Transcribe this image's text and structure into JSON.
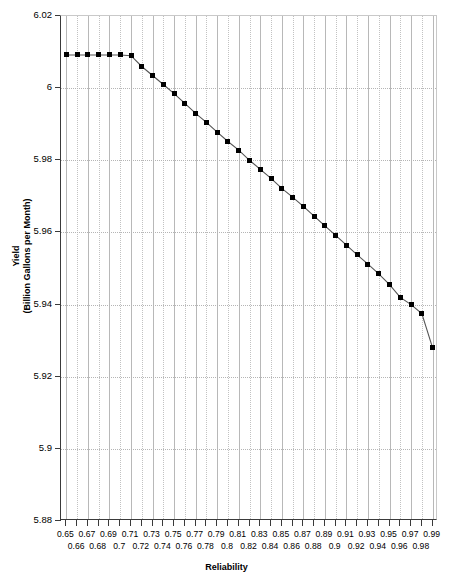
{
  "chart_data": {
    "type": "line",
    "title": "",
    "xlabel": "Reliability",
    "ylabel_line1": "Yield",
    "ylabel_line2": "(Billion Gallons per Month)",
    "xlim": [
      0.645,
      0.995
    ],
    "ylim": [
      5.88,
      6.02
    ],
    "grid": "vertical gridlines at every x tick (alternating solid/dotted), horizontal dotted gridlines at every y tick",
    "legend": "none",
    "marker": "filled black square",
    "line_color": "#555555",
    "marker_color": "#000000",
    "y_ticks": [
      5.88,
      5.9,
      5.92,
      5.94,
      5.96,
      5.98,
      6.0,
      6.02
    ],
    "y_tick_labels": [
      "5.88",
      "5.9",
      "5.92",
      "5.94",
      "5.96",
      "5.98",
      "6",
      "6.02"
    ],
    "x_ticks": [
      0.65,
      0.66,
      0.67,
      0.68,
      0.69,
      0.7,
      0.71,
      0.72,
      0.73,
      0.74,
      0.75,
      0.76,
      0.77,
      0.78,
      0.79,
      0.8,
      0.81,
      0.82,
      0.83,
      0.84,
      0.85,
      0.86,
      0.87,
      0.88,
      0.89,
      0.9,
      0.91,
      0.92,
      0.93,
      0.94,
      0.95,
      0.96,
      0.97,
      0.98,
      0.99
    ],
    "x_tick_labels_row1": [
      "0.65",
      "0.67",
      "0.69",
      "0.71",
      "0.73",
      "0.75",
      "0.77",
      "0.79",
      "0.81",
      "0.83",
      "0.85",
      "0.87",
      "0.89",
      "0.91",
      "0.93",
      "0.95",
      "0.97",
      "0.99"
    ],
    "x_tick_labels_row2": [
      "0.66",
      "0.68",
      "0.7",
      "0.72",
      "0.74",
      "0.76",
      "0.78",
      "0.8",
      "0.82",
      "0.84",
      "0.86",
      "0.88",
      "0.9",
      "0.92",
      "0.94",
      "0.96",
      "0.98"
    ],
    "x": [
      0.65,
      0.66,
      0.67,
      0.68,
      0.69,
      0.7,
      0.71,
      0.72,
      0.73,
      0.74,
      0.75,
      0.76,
      0.77,
      0.78,
      0.79,
      0.8,
      0.81,
      0.82,
      0.83,
      0.84,
      0.85,
      0.86,
      0.87,
      0.88,
      0.89,
      0.9,
      0.91,
      0.92,
      0.93,
      0.94,
      0.95,
      0.96,
      0.97,
      0.98,
      0.99
    ],
    "values": [
      6.0092,
      6.0092,
      6.0092,
      6.0092,
      6.0092,
      6.0092,
      6.009,
      6.006,
      6.0035,
      6.001,
      5.9985,
      5.9958,
      5.993,
      5.9905,
      5.9878,
      5.9852,
      5.9828,
      5.98,
      5.9775,
      5.975,
      5.9722,
      5.9698,
      5.9672,
      5.9645,
      5.9618,
      5.9592,
      5.9565,
      5.9538,
      5.9512,
      5.9485,
      5.9455,
      5.942,
      5.94,
      5.9375,
      5.928
    ],
    "series_name": "Yield vs Reliability"
  },
  "axes": {
    "x_title": "Reliability",
    "y_title_line1": "Yield",
    "y_title_line2": "(Billion Gallons per Month)"
  }
}
